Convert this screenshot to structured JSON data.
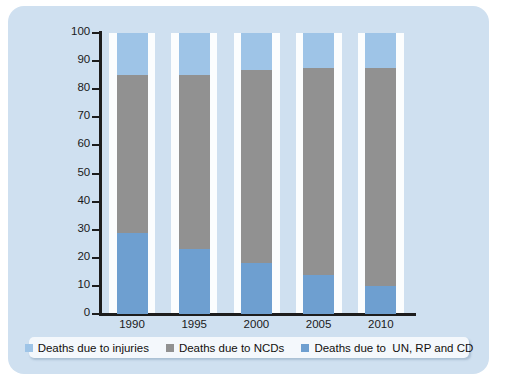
{
  "chart_data": {
    "type": "bar",
    "subtype": "stacked-bar-100percent",
    "title": "",
    "xlabel": "",
    "ylabel": "",
    "categories": [
      "1990",
      "1995",
      "2000",
      "2005",
      "2010"
    ],
    "ylim": [
      0,
      100
    ],
    "yticks": [
      0,
      10,
      20,
      30,
      40,
      50,
      60,
      70,
      80,
      90,
      100
    ],
    "ytick_labels": [
      "0",
      "10",
      "20",
      "30",
      "40",
      "50",
      "60",
      "70",
      "80",
      "90",
      "100"
    ],
    "grid": false,
    "legend_position": "bottom",
    "stack_order_bottom_to_top": [
      "Deaths due to  UN, RP and CD",
      "Deaths due to NCDs",
      "Deaths due to injuries"
    ],
    "series": [
      {
        "name": "Deaths due to  UN, RP and CD",
        "color": "#6e9fd0",
        "values": [
          29,
          23,
          18,
          14,
          10
        ]
      },
      {
        "name": "Deaths due to NCDs",
        "color": "#919191",
        "values": [
          56,
          62,
          69,
          73.5,
          77.5
        ]
      },
      {
        "name": "Deaths due to injuries",
        "color": "#9ec4e7",
        "values": [
          15,
          15,
          13,
          12.5,
          12.5
        ]
      }
    ],
    "cumulative_tops": {
      "1990": [
        29,
        85,
        100
      ],
      "1995": [
        23,
        85,
        100
      ],
      "2000": [
        18,
        87,
        100
      ],
      "2005": [
        14,
        87.5,
        100
      ],
      "2010": [
        10,
        87.5,
        100
      ]
    }
  },
  "legend": {
    "items": [
      {
        "label": "Deaths due to injuries",
        "color": "#9ec4e7"
      },
      {
        "label": "Deaths due to NCDs",
        "color": "#919191"
      },
      {
        "label": "Deaths due to  UN, RP and CD",
        "color": "#6e9fd0"
      }
    ]
  },
  "colors": {
    "panel_background": "#cfe0f0",
    "plot_band": "#fbfdfe",
    "axis": "#1d1d1d",
    "legend_background": "#f4f8fc",
    "injuries": "#9ec4e7",
    "ncds": "#919191",
    "un_rp_cd": "#6e9fd0"
  }
}
